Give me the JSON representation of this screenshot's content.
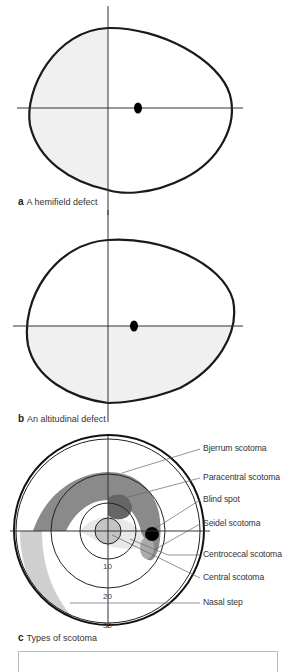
{
  "panels": [
    {
      "letter": "a",
      "caption": "A hemifield defect",
      "shaded_region": "left half"
    },
    {
      "letter": "b",
      "caption": "An altitudinal defect",
      "shaded_region": "lower half"
    },
    {
      "letter": "c",
      "caption": "Types of scotoma"
    }
  ],
  "scotoma_labels": [
    "Bjerrum scotoma",
    "Paracentral scotoma",
    "Blind spot",
    "Seidel scotoma",
    "Centrocecal scotoma",
    "Central scotoma",
    "Nasal step"
  ],
  "ring_ticks": [
    "10",
    "20",
    "30"
  ],
  "colors": {
    "outline": "#1a1a1a",
    "axis": "#333333",
    "defect_fill": "#f0f0f0",
    "bjerrum": "#8a8a8a",
    "paracentral": "#666666",
    "central": "#c4c4c4",
    "nasal_step": "#cfcfcf",
    "blind_spot": "#000000"
  }
}
